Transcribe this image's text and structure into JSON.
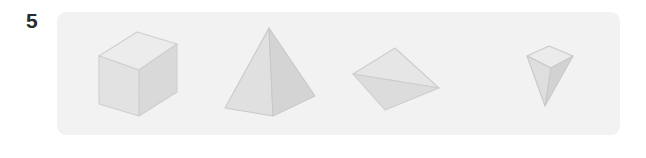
{
  "question": {
    "number": "5"
  },
  "panel": {
    "background_color": "#f2f2f2",
    "corner_radius_px": 9
  },
  "page": {
    "background_color": "#ffffff"
  },
  "figures": [
    {
      "id": "rectangular-prism",
      "name": "rectangular prism",
      "orientation": "upright, viewed from above-left",
      "visible_faces": 3,
      "face_colors": {
        "top": "#ececec",
        "left": "#e2e2e2",
        "right": "#d9d9d9"
      },
      "outline_color": "#cfcfcf"
    },
    {
      "id": "square-pyramid",
      "name": "square pyramid",
      "orientation": "apex up",
      "visible_faces": 2,
      "face_colors": {
        "left": "#e0e0e0",
        "right": "#d4d4d4"
      },
      "outline_color": "#c9c9c9"
    },
    {
      "id": "tetrahedron",
      "name": "tetrahedron",
      "orientation": "tilted, apex upper-left",
      "visible_faces": 2,
      "face_colors": {
        "upper": "#e6e6e6",
        "lower": "#dcdcdc"
      },
      "outline_color": "#cdcdcd"
    },
    {
      "id": "inverted-pyramid",
      "name": "inverted square pyramid",
      "orientation": "apex down",
      "visible_faces": 3,
      "face_colors": {
        "top": "#ebebeb",
        "left": "#dedede",
        "right": "#d2d2d2"
      },
      "outline_color": "#c9c9c9"
    }
  ]
}
